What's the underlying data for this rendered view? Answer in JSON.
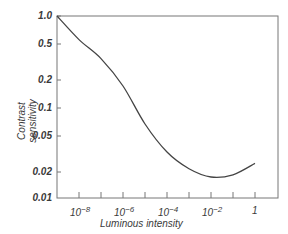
{
  "chart_data": {
    "type": "line",
    "title": "",
    "xlabel": "Luminous intensity",
    "ylabel": "Contrast sensitivity",
    "xscale": "log",
    "yscale": "log",
    "xlim": [
      1e-09,
      12
    ],
    "ylim": [
      0.01,
      1.0
    ],
    "x_tick_labels": [
      "10^-8",
      "10^-6",
      "10^-4",
      "10^-2",
      "1"
    ],
    "y_tick_labels": [
      "1.0",
      "0.5",
      "0.2",
      "0.1",
      "0.05",
      "0.02",
      "0.01"
    ],
    "grid": false,
    "legend": null,
    "series": [
      {
        "name": "Contrast sensitivity",
        "x": [
          1e-09,
          1e-08,
          1e-07,
          1e-06,
          1e-05,
          0.0001,
          0.001,
          0.01,
          0.1,
          1
        ],
        "values": [
          1.0,
          0.55,
          0.34,
          0.17,
          0.065,
          0.032,
          0.021,
          0.017,
          0.018,
          0.024
        ]
      }
    ]
  },
  "labels": {
    "x_title": "Luminous intensity",
    "y_title_line1": "Contrast",
    "y_title_line2": "sensitivity",
    "y_ticks": [
      "1.0",
      "0.5",
      "0.2",
      "0.1",
      "0.05",
      "0.02",
      "0.01"
    ],
    "x_ticks_base": [
      "10",
      "10",
      "10",
      "10",
      "1"
    ],
    "x_ticks_exp": [
      "−8",
      "−6",
      "−4",
      "−2",
      ""
    ]
  }
}
